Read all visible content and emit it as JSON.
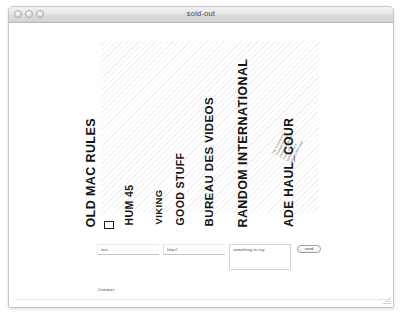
{
  "window": {
    "title": "sold-out",
    "controls": [
      "close-button",
      "minimize-button",
      "zoom-button"
    ]
  },
  "page": {
    "headlines": [
      {
        "label": "OLD MAC RULES",
        "left": 88,
        "bottom": 192,
        "size": 12.5
      },
      {
        "label": "HUM 45",
        "left": 125,
        "bottom": 192,
        "size": 10.5
      },
      {
        "label": "VIKING",
        "left": 154,
        "bottom": 192,
        "size": 9.5
      },
      {
        "label": "GOOD STUFF",
        "left": 176,
        "bottom": 192,
        "size": 10.5
      },
      {
        "label": "BUREAU DES VIDEOS",
        "left": 206,
        "bottom": 192,
        "size": 11.5
      },
      {
        "label": "RANDOM INTERNATIONAL",
        "left": 240,
        "bottom": 192,
        "size": 12.5
      },
      {
        "label": "ADE HAUL_COUR",
        "left": 286,
        "bottom": 192,
        "size": 12.0
      }
    ],
    "tilt_note_lines": [
      "Pour la premiere fois",
      "le collectif presente",
      "une selection de ses",
      "travaux video et",
      "sonores dans un",
      "espace ouvert a tous"
    ],
    "checkbox": {
      "checked": false
    },
    "form": {
      "text_field": {
        "value": "text",
        "placeholder": "text"
      },
      "url_field": {
        "value": "http://",
        "placeholder": "http://"
      },
      "note_field": {
        "value": "something to say",
        "placeholder": "something to say"
      },
      "send_label": "send"
    },
    "contact_label": "Contact"
  },
  "colors": {
    "ink": "#141414",
    "chrome": "#dcdcdc",
    "rule": "#e6e6e6"
  }
}
